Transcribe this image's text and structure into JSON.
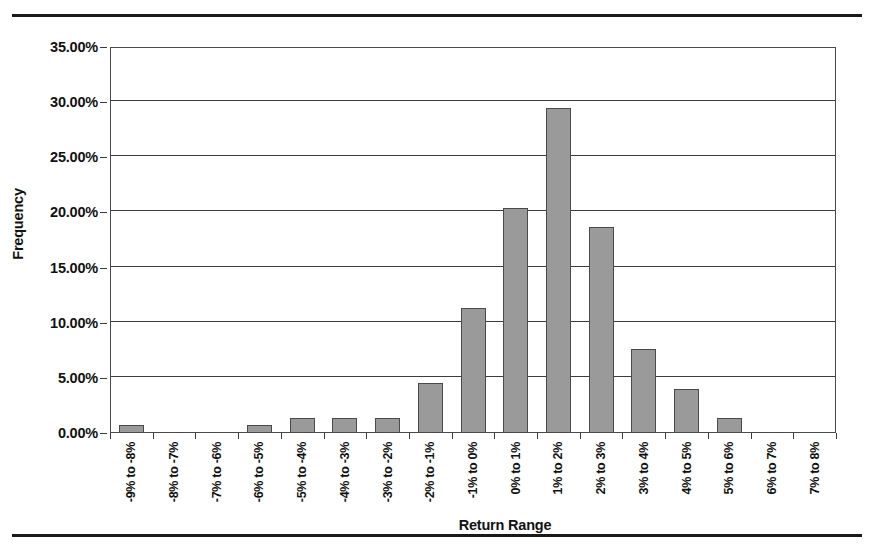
{
  "figure": {
    "has_top_rule": true,
    "has_bottom_rule": true,
    "background_color": "#ffffff",
    "bar_fill_color": "#9a9a9a",
    "bar_border_color": "#4a4a4a",
    "axis_color": "#3c3c3c"
  },
  "chart_data": {
    "type": "bar",
    "title": "",
    "subtitle": "",
    "xlabel": "Return Range",
    "ylabel": "Frequency",
    "categories": [
      "-9% to -8%",
      "-8% to -7%",
      "-7% to -6%",
      "-6% to -5%",
      "-5% to -4%",
      "-4% to -3%",
      "-3% to -2%",
      "-2% to -1%",
      "-1% to 0%",
      "0% to 1%",
      "1% to 2%",
      "2% to 3%",
      "3% to 4%",
      "4% to 5%",
      "5% to 6%",
      "6% to 7%",
      "7% to 8%"
    ],
    "values": [
      0.7,
      0.0,
      0.0,
      0.7,
      1.35,
      1.35,
      1.35,
      4.5,
      11.3,
      20.4,
      29.5,
      18.7,
      7.6,
      4.0,
      1.4,
      0.0,
      0.0
    ],
    "value_unit": "%",
    "ylim": [
      0,
      35
    ],
    "ytick_values": [
      0,
      5,
      10,
      15,
      20,
      25,
      30,
      35
    ],
    "ytick_labels": [
      "0.00%",
      "5.00%",
      "10.00%",
      "15.00%",
      "20.00%",
      "25.00%",
      "30.00%",
      "35.00%"
    ],
    "grid": true,
    "grid_axis": "y",
    "legend": false,
    "legend_position": "none",
    "xtick_label_rotation": -90
  }
}
